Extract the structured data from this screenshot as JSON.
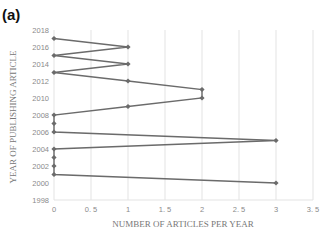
{
  "panel_label": "(a)",
  "chart_data": {
    "type": "line",
    "title": "",
    "xlabel": "NUMBER OF ARTICLES PER YEAR",
    "ylabel": "YEAR OF PUBLISHING ARTICLE",
    "xlim": [
      0,
      3.5
    ],
    "ylim": [
      1998,
      2018
    ],
    "x_ticks": [
      "0",
      "0.5",
      "1",
      "1.5",
      "2",
      "2.5",
      "3",
      "3.5"
    ],
    "y_ticks": [
      "1998",
      "2000",
      "2002",
      "2004",
      "2006",
      "2008",
      "2010",
      "2012",
      "2014",
      "2016",
      "2018"
    ],
    "grid": "vertical",
    "series": [
      {
        "name": "Articles",
        "color": "#6b6b6b",
        "points": [
          {
            "year": 2000,
            "count": 3
          },
          {
            "year": 2001,
            "count": 0
          },
          {
            "year": 2002,
            "count": 0
          },
          {
            "year": 2003,
            "count": 0
          },
          {
            "year": 2004,
            "count": 0
          },
          {
            "year": 2005,
            "count": 3
          },
          {
            "year": 2006,
            "count": 0
          },
          {
            "year": 2007,
            "count": 0
          },
          {
            "year": 2008,
            "count": 0
          },
          {
            "year": 2009,
            "count": 1
          },
          {
            "year": 2010,
            "count": 2
          },
          {
            "year": 2011,
            "count": 2
          },
          {
            "year": 2012,
            "count": 1
          },
          {
            "year": 2013,
            "count": 0
          },
          {
            "year": 2014,
            "count": 1
          },
          {
            "year": 2015,
            "count": 0
          },
          {
            "year": 2016,
            "count": 1
          },
          {
            "year": 2017,
            "count": 0
          }
        ]
      }
    ]
  }
}
